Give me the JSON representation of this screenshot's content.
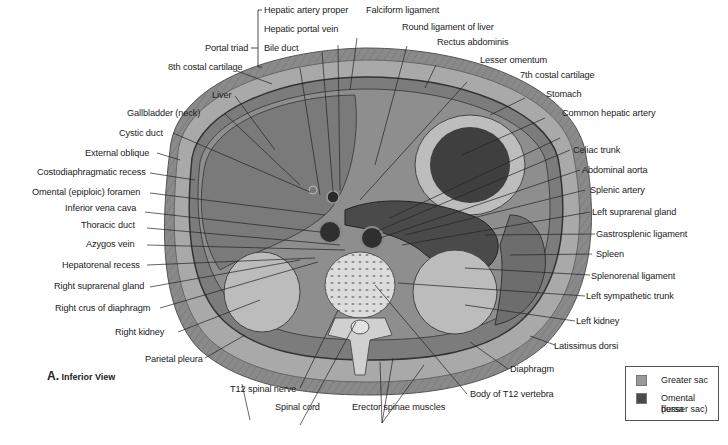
{
  "figure": {
    "caption_letter": "A.",
    "caption_text": "Inferior View",
    "portal_triad": {
      "group_label": "Portal triad",
      "members": [
        "Hepatic artery proper",
        "Hepatic portal vein",
        "Bile duct"
      ]
    },
    "labels_top": [
      "Falciform ligament",
      "Round ligament of liver",
      "Rectus abdominis",
      "Lesser omentum",
      "7th costal cartilage",
      "Stomach",
      "Common hepatic artery"
    ],
    "labels_left": [
      "8th costal cartilage",
      "Liver",
      "Gallbladder (neck)",
      "Cystic duct",
      "External oblique",
      "Costodiaphragmatic recess",
      "Omental (epiploic) foramen",
      "Inferior vena cava",
      "Thoracic duct",
      "Azygos vein",
      "Hepatorenal recess",
      "Right suprarenal gland",
      "Right crus of diaphragm",
      "Right kidney",
      "Parietal pleura"
    ],
    "labels_right": [
      "Celiac trunk",
      "Abdominal aorta",
      "Splenic artery",
      "Left suprarenal gland",
      "Gastrosplenic ligament",
      "Spleen",
      "Splenorenal ligament",
      "Left sympathetic trunk",
      "Left kidney",
      "Latissimus dorsi",
      "Diaphragm"
    ],
    "labels_bottom": [
      "T12 spinal nerve",
      "Spinal cord",
      "Erector spinae muscles",
      "Body of T12 vertebra"
    ],
    "legend": {
      "items": [
        {
          "label": "Greater sac",
          "color": "#9a9a9a"
        },
        {
          "label": "Omental bursa (lesser sac)",
          "line1": "Omental bursa",
          "line2": "(lesser sac)",
          "color": "#4a4a4a"
        }
      ]
    }
  }
}
